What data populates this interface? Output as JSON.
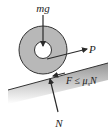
{
  "diagram": {
    "type": "free-body-diagram",
    "labels": {
      "weight": "mg",
      "applied_force": "P",
      "friction": "F ≤ μ",
      "friction_sub": "s",
      "friction_tail": "N",
      "normal": "N"
    },
    "colors": {
      "wheel_fill": "#b8b8b8",
      "wheel_stroke": "#333333",
      "arrow": "#2a2a2a",
      "surface_dark": "#7a7a7a",
      "surface_light": "#ffffff"
    }
  }
}
